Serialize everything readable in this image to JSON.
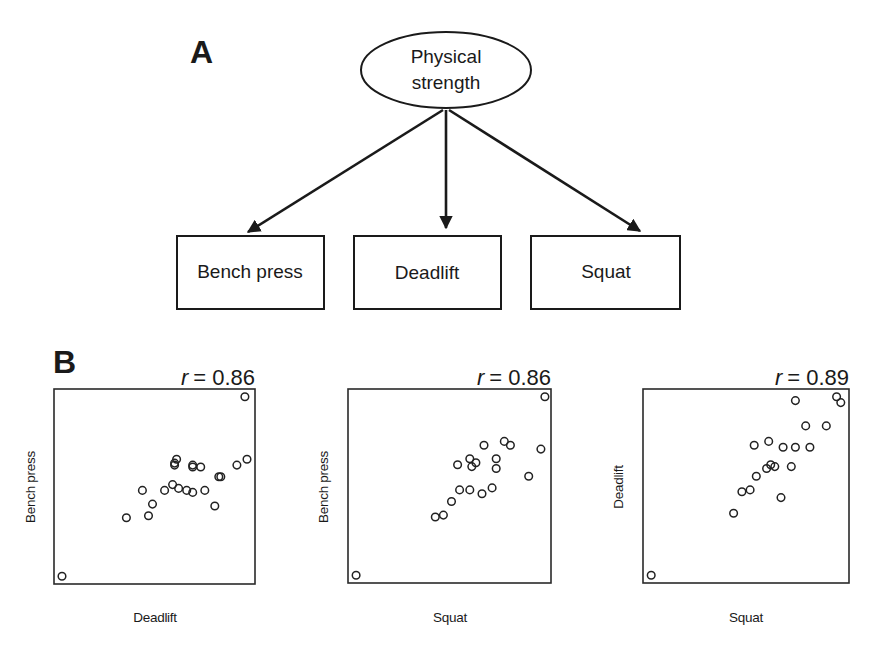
{
  "panel_a": {
    "label": "A",
    "latent": {
      "line1": "Physical",
      "line2": "strength"
    },
    "indicators": [
      {
        "label": "Bench press"
      },
      {
        "label": "Deadlift"
      },
      {
        "label": "Squat"
      }
    ]
  },
  "panel_b": {
    "label": "B",
    "plots": [
      {
        "r_label": "r",
        "r_value": "= 0.86",
        "xlabel": "Deadlift",
        "ylabel": "Bench press"
      },
      {
        "r_label": "r",
        "r_value": "= 0.86",
        "xlabel": "Squat",
        "ylabel": "Bench press"
      },
      {
        "r_label": "r",
        "r_value": "= 0.89",
        "xlabel": "Squat",
        "ylabel": "Deadlift"
      }
    ]
  },
  "chart_data": [
    {
      "type": "scatter",
      "title": "r = 0.86",
      "xlabel": "Deadlift",
      "ylabel": "Bench press",
      "r": 0.86,
      "grid": false,
      "note": "Coordinates normalized 0-1 within plot frame (x right, y up); no tick labels shown",
      "points": [
        [
          0.04,
          0.04
        ],
        [
          0.36,
          0.34
        ],
        [
          0.47,
          0.35
        ],
        [
          0.49,
          0.41
        ],
        [
          0.44,
          0.48
        ],
        [
          0.55,
          0.48
        ],
        [
          0.59,
          0.51
        ],
        [
          0.62,
          0.49
        ],
        [
          0.66,
          0.48
        ],
        [
          0.69,
          0.47
        ],
        [
          0.6,
          0.61
        ],
        [
          0.6,
          0.62
        ],
        [
          0.61,
          0.64
        ],
        [
          0.75,
          0.48
        ],
        [
          0.82,
          0.55
        ],
        [
          0.83,
          0.55
        ],
        [
          0.69,
          0.6
        ],
        [
          0.69,
          0.61
        ],
        [
          0.73,
          0.6
        ],
        [
          0.8,
          0.4
        ],
        [
          0.91,
          0.61
        ],
        [
          0.96,
          0.64
        ],
        [
          0.95,
          0.96
        ]
      ]
    },
    {
      "type": "scatter",
      "title": "r = 0.86",
      "xlabel": "Squat",
      "ylabel": "Bench press",
      "r": 0.86,
      "grid": false,
      "note": "Coordinates normalized 0-1 within plot frame (x right, y up); no tick labels shown",
      "points": [
        [
          0.04,
          0.04
        ],
        [
          0.43,
          0.34
        ],
        [
          0.47,
          0.35
        ],
        [
          0.51,
          0.42
        ],
        [
          0.55,
          0.48
        ],
        [
          0.6,
          0.48
        ],
        [
          0.66,
          0.46
        ],
        [
          0.71,
          0.49
        ],
        [
          0.54,
          0.61
        ],
        [
          0.6,
          0.64
        ],
        [
          0.61,
          0.6
        ],
        [
          0.63,
          0.62
        ],
        [
          0.73,
          0.59
        ],
        [
          0.73,
          0.64
        ],
        [
          0.67,
          0.71
        ],
        [
          0.77,
          0.73
        ],
        [
          0.8,
          0.71
        ],
        [
          0.89,
          0.55
        ],
        [
          0.95,
          0.69
        ],
        [
          0.97,
          0.96
        ]
      ]
    },
    {
      "type": "scatter",
      "title": "r = 0.89",
      "xlabel": "Squat",
      "ylabel": "Deadlift",
      "r": 0.89,
      "grid": false,
      "note": "Coordinates normalized 0-1 within plot frame (x right, y up); no tick labels shown",
      "points": [
        [
          0.04,
          0.04
        ],
        [
          0.44,
          0.36
        ],
        [
          0.48,
          0.47
        ],
        [
          0.52,
          0.48
        ],
        [
          0.55,
          0.55
        ],
        [
          0.6,
          0.59
        ],
        [
          0.62,
          0.61
        ],
        [
          0.64,
          0.6
        ],
        [
          0.72,
          0.6
        ],
        [
          0.67,
          0.44
        ],
        [
          0.54,
          0.71
        ],
        [
          0.61,
          0.73
        ],
        [
          0.68,
          0.7
        ],
        [
          0.74,
          0.7
        ],
        [
          0.81,
          0.7
        ],
        [
          0.79,
          0.81
        ],
        [
          0.89,
          0.81
        ],
        [
          0.74,
          0.94
        ],
        [
          0.94,
          0.96
        ],
        [
          0.96,
          0.93
        ]
      ]
    }
  ]
}
